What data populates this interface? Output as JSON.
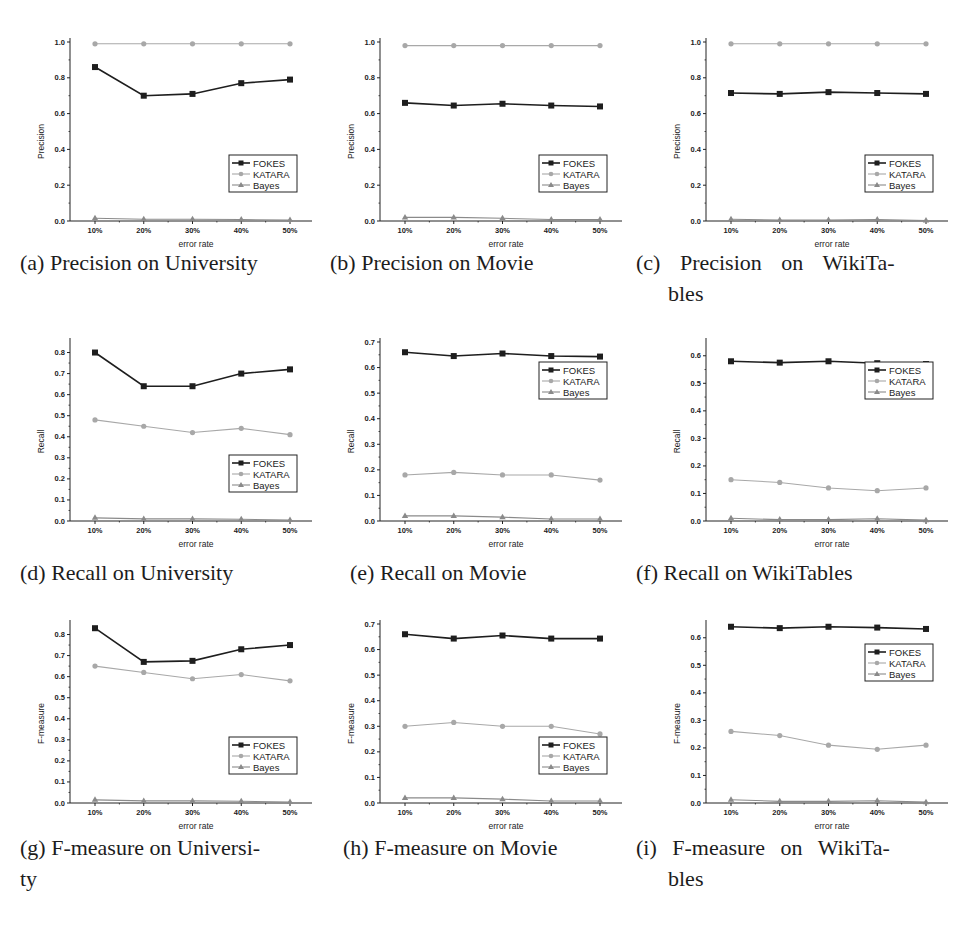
{
  "figure": {
    "x_ticks": [
      "10%",
      "20%",
      "30%",
      "40%",
      "50%"
    ],
    "x_label": "error rate",
    "legend": [
      "FOKES",
      "KATARA",
      "Bayes"
    ],
    "colors": {
      "FOKES": "#1e1e1e",
      "KATARA": "#a8a8a8",
      "Bayes": "#8a8a8a"
    }
  },
  "captions": [
    {
      "id": "a",
      "line1": "(a) Precision on University",
      "line2": ""
    },
    {
      "id": "b",
      "line1": "(b) Precision on Movie",
      "line2": ""
    },
    {
      "id": "c",
      "line1": "(c) Precision on WikiTa-",
      "line2": "bles"
    },
    {
      "id": "d",
      "line1": "(d) Recall on University",
      "line2": ""
    },
    {
      "id": "e",
      "line1": "(e) Recall on Movie",
      "line2": ""
    },
    {
      "id": "f",
      "line1": "(f) Recall on WikiTables",
      "line2": ""
    },
    {
      "id": "g",
      "line1": "(g) F-measure on Universi-",
      "line2": "ty"
    },
    {
      "id": "h",
      "line1": "(h) F-measure on Movie",
      "line2": ""
    },
    {
      "id": "i",
      "line1": "(i) F-measure on WikiTa-",
      "line2": "bles"
    }
  ],
  "chart_data": [
    {
      "id": "a",
      "type": "line",
      "title": "Precision on University",
      "xlabel": "error rate",
      "ylabel": "Precision",
      "categories": [
        "10%",
        "20%",
        "30%",
        "40%",
        "50%"
      ],
      "ylim": [
        0,
        1.0
      ],
      "yticks": [
        0.0,
        0.2,
        0.4,
        0.6,
        0.8,
        1.0
      ],
      "ydecimals": 1,
      "legend_position": "lower-right",
      "series": [
        {
          "name": "FOKES",
          "values": [
            0.86,
            0.7,
            0.71,
            0.77,
            0.79
          ]
        },
        {
          "name": "KATARA",
          "values": [
            0.99,
            0.99,
            0.99,
            0.99,
            0.99
          ]
        },
        {
          "name": "Bayes",
          "values": [
            0.015,
            0.01,
            0.01,
            0.008,
            0.005
          ]
        }
      ]
    },
    {
      "id": "b",
      "type": "line",
      "title": "Precision on Movie",
      "xlabel": "error rate",
      "ylabel": "Precision",
      "categories": [
        "10%",
        "20%",
        "30%",
        "40%",
        "50%"
      ],
      "ylim": [
        0,
        1.0
      ],
      "yticks": [
        0.0,
        0.2,
        0.4,
        0.6,
        0.8,
        1.0
      ],
      "ydecimals": 1,
      "legend_position": "lower-right",
      "series": [
        {
          "name": "FOKES",
          "values": [
            0.66,
            0.645,
            0.655,
            0.645,
            0.64
          ]
        },
        {
          "name": "KATARA",
          "values": [
            0.98,
            0.98,
            0.98,
            0.98,
            0.98
          ]
        },
        {
          "name": "Bayes",
          "values": [
            0.02,
            0.02,
            0.015,
            0.008,
            0.008
          ]
        }
      ]
    },
    {
      "id": "c",
      "type": "line",
      "title": "Precision on WikiTables",
      "xlabel": "error rate",
      "ylabel": "Precision",
      "categories": [
        "10%",
        "20%",
        "30%",
        "40%",
        "50%"
      ],
      "ylim": [
        0,
        1.0
      ],
      "yticks": [
        0.0,
        0.2,
        0.4,
        0.6,
        0.8,
        1.0
      ],
      "ydecimals": 1,
      "legend_position": "lower-right",
      "series": [
        {
          "name": "FOKES",
          "values": [
            0.715,
            0.71,
            0.72,
            0.715,
            0.71
          ]
        },
        {
          "name": "KATARA",
          "values": [
            0.99,
            0.99,
            0.99,
            0.99,
            0.99
          ]
        },
        {
          "name": "Bayes",
          "values": [
            0.01,
            0.005,
            0.005,
            0.008,
            0.003
          ]
        }
      ]
    },
    {
      "id": "d",
      "type": "line",
      "title": "Recall on University",
      "xlabel": "error rate",
      "ylabel": "Recall",
      "categories": [
        "10%",
        "20%",
        "30%",
        "40%",
        "50%"
      ],
      "ylim": [
        0,
        0.85
      ],
      "yticks": [
        0.0,
        0.1,
        0.2,
        0.3,
        0.4,
        0.5,
        0.6,
        0.7,
        0.8
      ],
      "ydecimals": 1,
      "legend_position": "lower-right",
      "series": [
        {
          "name": "FOKES",
          "values": [
            0.8,
            0.64,
            0.64,
            0.7,
            0.72
          ]
        },
        {
          "name": "KATARA",
          "values": [
            0.48,
            0.45,
            0.42,
            0.44,
            0.41
          ]
        },
        {
          "name": "Bayes",
          "values": [
            0.015,
            0.01,
            0.01,
            0.008,
            0.005
          ]
        }
      ]
    },
    {
      "id": "e",
      "type": "line",
      "title": "Recall on Movie",
      "xlabel": "error rate",
      "ylabel": "Recall",
      "categories": [
        "10%",
        "20%",
        "30%",
        "40%",
        "50%"
      ],
      "ylim": [
        0,
        0.7
      ],
      "yticks": [
        0.0,
        0.1,
        0.2,
        0.3,
        0.4,
        0.5,
        0.6,
        0.7
      ],
      "ydecimals": 1,
      "legend_position": "upper-right",
      "series": [
        {
          "name": "FOKES",
          "values": [
            0.66,
            0.645,
            0.655,
            0.645,
            0.643
          ]
        },
        {
          "name": "KATARA",
          "values": [
            0.18,
            0.19,
            0.18,
            0.18,
            0.16
          ]
        },
        {
          "name": "Bayes",
          "values": [
            0.02,
            0.02,
            0.015,
            0.008,
            0.008
          ]
        }
      ]
    },
    {
      "id": "f",
      "type": "line",
      "title": "Recall on WikiTables",
      "xlabel": "error rate",
      "ylabel": "Recall",
      "categories": [
        "10%",
        "20%",
        "30%",
        "40%",
        "50%"
      ],
      "ylim": [
        0,
        0.65
      ],
      "yticks": [
        0.0,
        0.1,
        0.2,
        0.3,
        0.4,
        0.5,
        0.6
      ],
      "ydecimals": 1,
      "legend_position": "upper-right",
      "series": [
        {
          "name": "FOKES",
          "values": [
            0.58,
            0.575,
            0.58,
            0.573,
            0.57
          ]
        },
        {
          "name": "KATARA",
          "values": [
            0.15,
            0.14,
            0.12,
            0.11,
            0.12
          ]
        },
        {
          "name": "Bayes",
          "values": [
            0.01,
            0.005,
            0.005,
            0.008,
            0.003
          ]
        }
      ]
    },
    {
      "id": "g",
      "type": "line",
      "title": "F-measure on University",
      "xlabel": "error rate",
      "ylabel": "F-measure",
      "categories": [
        "10%",
        "20%",
        "30%",
        "40%",
        "50%"
      ],
      "ylim": [
        0,
        0.85
      ],
      "yticks": [
        0.0,
        0.1,
        0.2,
        0.3,
        0.4,
        0.5,
        0.6,
        0.7,
        0.8
      ],
      "ydecimals": 1,
      "legend_position": "lower-right",
      "series": [
        {
          "name": "FOKES",
          "values": [
            0.83,
            0.67,
            0.675,
            0.73,
            0.75
          ]
        },
        {
          "name": "KATARA",
          "values": [
            0.65,
            0.62,
            0.59,
            0.61,
            0.58
          ]
        },
        {
          "name": "Bayes",
          "values": [
            0.015,
            0.01,
            0.01,
            0.008,
            0.005
          ]
        }
      ]
    },
    {
      "id": "h",
      "type": "line",
      "title": "F-measure on Movie",
      "xlabel": "error rate",
      "ylabel": "F-measure",
      "categories": [
        "10%",
        "20%",
        "30%",
        "40%",
        "50%"
      ],
      "ylim": [
        0,
        0.7
      ],
      "yticks": [
        0.0,
        0.1,
        0.2,
        0.3,
        0.4,
        0.5,
        0.6,
        0.7
      ],
      "ydecimals": 1,
      "legend_position": "lower-right",
      "series": [
        {
          "name": "FOKES",
          "values": [
            0.66,
            0.643,
            0.655,
            0.643,
            0.643
          ]
        },
        {
          "name": "KATARA",
          "values": [
            0.3,
            0.315,
            0.3,
            0.3,
            0.27
          ]
        },
        {
          "name": "Bayes",
          "values": [
            0.02,
            0.02,
            0.015,
            0.008,
            0.008
          ]
        }
      ]
    },
    {
      "id": "i",
      "type": "line",
      "title": "F-measure on WikiTables",
      "xlabel": "error rate",
      "ylabel": "F-measure",
      "categories": [
        "10%",
        "20%",
        "30%",
        "40%",
        "50%"
      ],
      "ylim": [
        0,
        0.65
      ],
      "yticks": [
        0.0,
        0.1,
        0.2,
        0.3,
        0.4,
        0.5,
        0.6
      ],
      "ydecimals": 1,
      "legend_position": "upper-right",
      "series": [
        {
          "name": "FOKES",
          "values": [
            0.64,
            0.635,
            0.64,
            0.637,
            0.632
          ]
        },
        {
          "name": "KATARA",
          "values": [
            0.26,
            0.245,
            0.21,
            0.195,
            0.21
          ]
        },
        {
          "name": "Bayes",
          "values": [
            0.012,
            0.006,
            0.006,
            0.008,
            0.003
          ]
        }
      ]
    }
  ]
}
